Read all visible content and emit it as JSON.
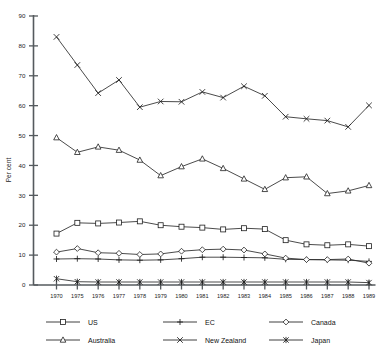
{
  "chart_data": {
    "type": "line",
    "title": "",
    "xlabel": "",
    "ylabel": "Per cent",
    "ylim": [
      0,
      90
    ],
    "ytick_step": 10,
    "yticks": [
      0,
      10,
      20,
      30,
      40,
      50,
      60,
      70,
      80,
      90
    ],
    "grid": false,
    "legend_position": "bottom",
    "categories": [
      "1970",
      "1975",
      "1976",
      "1977",
      "1978",
      "1979",
      "1980",
      "1981",
      "1982",
      "1983",
      "1984",
      "1985",
      "1986",
      "1987",
      "1988",
      "1989"
    ],
    "series": [
      {
        "name": "US",
        "marker": "square",
        "values": [
          17.2,
          20.8,
          20.6,
          20.9,
          21.3,
          20.0,
          19.5,
          19.2,
          18.6,
          19.0,
          18.7,
          15.0,
          13.6,
          13.3,
          13.6,
          13.0
        ]
      },
      {
        "name": "EC",
        "marker": "plus",
        "values": [
          8.7,
          8.8,
          8.7,
          8.4,
          8.3,
          8.4,
          8.8,
          9.3,
          9.3,
          9.2,
          9.1,
          8.6,
          8.5,
          8.4,
          8.3,
          7.9
        ]
      },
      {
        "name": "Canada",
        "marker": "diamond",
        "values": [
          11.0,
          12.2,
          10.8,
          10.6,
          10.2,
          10.4,
          11.3,
          11.8,
          12.0,
          11.7,
          10.4,
          9.0,
          8.5,
          8.5,
          8.7,
          7.3
        ]
      },
      {
        "name": "Australia",
        "marker": "triangle",
        "values": [
          49.3,
          44.4,
          46.2,
          45.1,
          41.8,
          36.6,
          39.6,
          42.2,
          39.0,
          35.5,
          32.0,
          35.9,
          36.2,
          30.6,
          31.5,
          33.3
        ]
      },
      {
        "name": "New Zealand",
        "marker": "x",
        "values": [
          83.0,
          73.6,
          64.2,
          68.6,
          59.5,
          61.4,
          61.3,
          64.6,
          62.7,
          66.5,
          63.3,
          56.3,
          55.6,
          55.0,
          52.9,
          60.1
        ]
      },
      {
        "name": "Japan",
        "marker": "star",
        "values": [
          2.1,
          1.1,
          1.0,
          1.0,
          1.0,
          1.0,
          1.0,
          1.0,
          1.0,
          1.0,
          1.0,
          1.0,
          1.0,
          1.0,
          1.0,
          0.8
        ]
      }
    ],
    "legend": [
      {
        "label": "US",
        "marker": "square"
      },
      {
        "label": "EC",
        "marker": "plus"
      },
      {
        "label": "Canada",
        "marker": "diamond"
      },
      {
        "label": "Australia",
        "marker": "triangle"
      },
      {
        "label": "New Zealand",
        "marker": "x"
      },
      {
        "label": "Japan",
        "marker": "star"
      }
    ],
    "colors": {
      "line": "#2a2a2a",
      "axis": "#555a5e",
      "text": "#1c1c1c",
      "background": "#ffffff"
    }
  }
}
